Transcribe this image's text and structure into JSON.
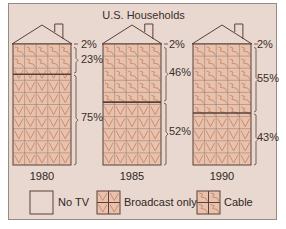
{
  "chart_data": {
    "type": "pictogram-stacked-bar",
    "title": "U.S. Households",
    "categories": [
      "1980",
      "1985",
      "1990"
    ],
    "series": [
      {
        "name": "No TV",
        "values": [
          2,
          2,
          2
        ]
      },
      {
        "name": "Cable",
        "values": [
          23,
          46,
          55
        ]
      },
      {
        "name": "Broadcast only",
        "values": [
          75,
          52,
          43
        ]
      }
    ],
    "labels": {
      "1980": [
        "2%",
        "23%",
        "75%"
      ],
      "1985": [
        "2%",
        "46%",
        "52%"
      ],
      "1990": [
        "2%",
        "55%",
        "43%"
      ]
    },
    "legend": [
      "No TV",
      "Broadcast only",
      "Cable"
    ],
    "legend_position": "bottom",
    "unit": "%"
  },
  "title": "U.S. Households",
  "houses": [
    {
      "year": "1980",
      "no_tv": "2%",
      "cable": "23%",
      "broadcast": "75%"
    },
    {
      "year": "1985",
      "no_tv": "2%",
      "cable": "46%",
      "broadcast": "52%"
    },
    {
      "year": "1990",
      "no_tv": "2%",
      "cable": "55%",
      "broadcast": "43%"
    }
  ],
  "legend": {
    "no_tv": "No TV",
    "broadcast": "Broadcast only",
    "cable": "Cable"
  },
  "colors": {
    "background": "#e9d8cf",
    "fill": "#e8c2ad",
    "line": "#5a4038",
    "pattern": "#c8876a"
  }
}
